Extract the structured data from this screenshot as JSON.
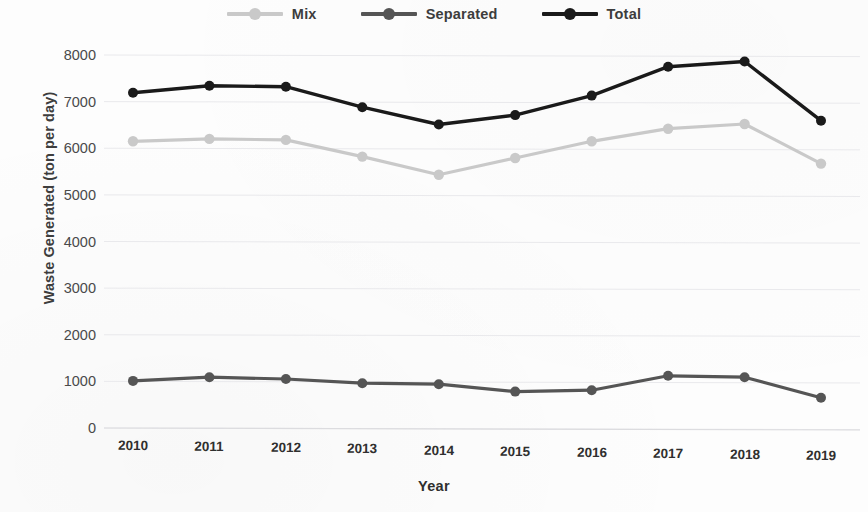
{
  "chart_data": {
    "type": "line",
    "title": "",
    "xlabel": "Year",
    "ylabel": "Waste Generated (ton per day)",
    "categories": [
      "2010",
      "2011",
      "2012",
      "2013",
      "2014",
      "2015",
      "2016",
      "2017",
      "2018",
      "2019"
    ],
    "x": [
      2010,
      2011,
      2012,
      2013,
      2014,
      2015,
      2016,
      2017,
      2018,
      2019
    ],
    "ylim": [
      0,
      8000
    ],
    "yticks": [
      0,
      1000,
      2000,
      3000,
      4000,
      5000,
      6000,
      7000,
      8000
    ],
    "ytick_labels": [
      "0",
      "1000",
      "2000",
      "3000",
      "4000",
      "5000",
      "6000",
      "7000",
      "8000"
    ],
    "grid": true,
    "grid_axis": "y",
    "legend_position": "top-center",
    "series": [
      {
        "name": "Mix",
        "color": "#c9c9c9",
        "marker": "circle",
        "values": [
          6150,
          6200,
          6180,
          5820,
          5430,
          5790,
          6150,
          6420,
          6520,
          5670
        ]
      },
      {
        "name": "Separated",
        "color": "#555555",
        "marker": "circle",
        "values": [
          1010,
          1090,
          1050,
          960,
          940,
          780,
          810,
          1120,
          1090,
          650
        ]
      },
      {
        "name": "Total",
        "color": "#1a1a1a",
        "marker": "circle",
        "values": [
          7190,
          7340,
          7320,
          6880,
          6510,
          6710,
          7130,
          7750,
          7860,
          6590
        ]
      }
    ]
  }
}
